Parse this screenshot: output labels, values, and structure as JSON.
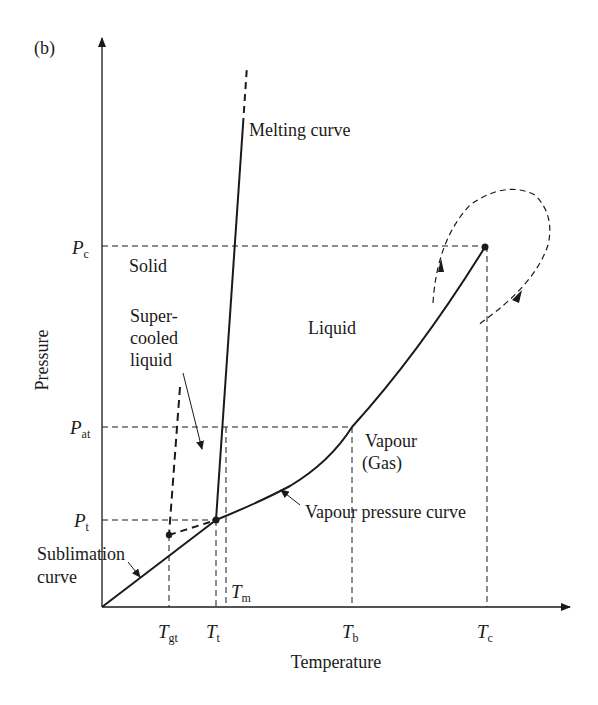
{
  "figure": {
    "panel_label": "(b)"
  },
  "axes": {
    "xlabel": "Temperature",
    "ylabel": "Pressure"
  },
  "x_ticks": [
    {
      "sym": "T",
      "sub": "gt"
    },
    {
      "sym": "T",
      "sub": "t"
    },
    {
      "sym": "T",
      "sub": "m"
    },
    {
      "sym": "T",
      "sub": "b"
    },
    {
      "sym": "T",
      "sub": "c"
    }
  ],
  "y_ticks": [
    {
      "sym": "P",
      "sub": "c"
    },
    {
      "sym": "P",
      "sub": "at"
    },
    {
      "sym": "P",
      "sub": "t"
    }
  ],
  "regions": {
    "solid": "Solid",
    "liquid": "Liquid",
    "vapour_line1": "Vapour",
    "vapour_line2": "(Gas)",
    "supercooled_line1": "Super-",
    "supercooled_line2": "cooled",
    "supercooled_line3": "liquid"
  },
  "curves": {
    "melting": "Melting curve",
    "vapour_pressure": "Vapour pressure curve",
    "sublimation_line1": "Sublimation",
    "sublimation_line2": "curve"
  },
  "colors": {
    "ink": "#1a1a1a",
    "background": "#ffffff"
  }
}
